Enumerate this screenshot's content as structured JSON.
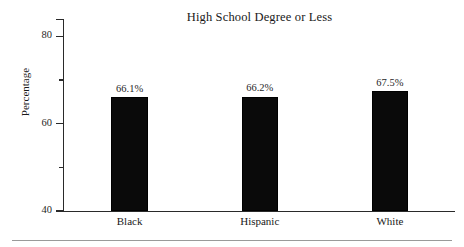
{
  "chart_data": {
    "type": "bar",
    "title": "High School Degree or Less",
    "xlabel": "",
    "ylabel": "Percentage",
    "categories": [
      "Black",
      "Hispanic",
      "White"
    ],
    "values": [
      66.1,
      66.2,
      67.5
    ],
    "value_labels": [
      "66.1%",
      "66.2%",
      "67.5%"
    ],
    "ylim": [
      40,
      84
    ],
    "ytick_labels": [
      "80",
      "60",
      "40"
    ],
    "ytick_values": [
      80,
      60,
      40
    ],
    "minor_tick_values": [
      70,
      50
    ],
    "grid": false,
    "legend": null,
    "bar_color": "#0a0a0a",
    "axis_color": "#2a2a2a",
    "text_color": "#191919",
    "background": "#ffffff"
  },
  "footer": {
    "rule_color": "#9a9a9a"
  }
}
